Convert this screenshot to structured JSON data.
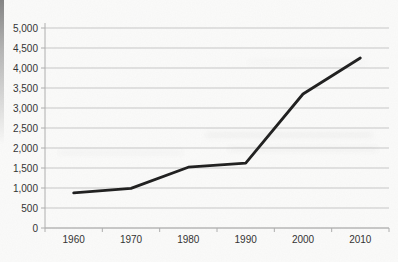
{
  "chart_data": {
    "type": "line",
    "title": "",
    "xlabel": "",
    "ylabel": "",
    "x": [
      1960,
      1970,
      1980,
      1990,
      2000,
      2010
    ],
    "xtick_labels": [
      "1960",
      "1970",
      "1980",
      "1990",
      "2000",
      "2010"
    ],
    "values": [
      880,
      990,
      1520,
      1620,
      3350,
      4250
    ],
    "ylim": [
      0,
      5000
    ],
    "ytick_step": 500,
    "ytick_labels": [
      "0",
      "500",
      "1,000",
      "1,500",
      "2,000",
      "2,500",
      "3,000",
      "3,500",
      "4,000",
      "4,500",
      "5,000"
    ],
    "grid": true,
    "legend": "none",
    "line_color": "#1c1c1c",
    "grid_color": "#c7c7c7",
    "axis_color": "#aeaeae",
    "label_color": "#2f2f2f",
    "background": "#fbfbfa"
  }
}
